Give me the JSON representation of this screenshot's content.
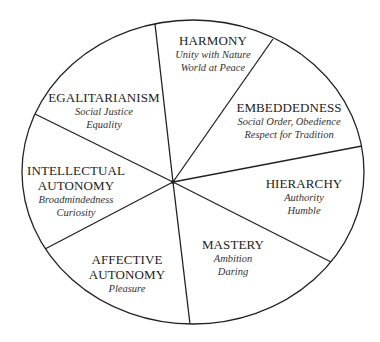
{
  "diagram": {
    "type": "circumplex",
    "colors": {
      "line": "#222222",
      "text": "#222222",
      "background": "#ffffff"
    },
    "segments": [
      {
        "title": [
          "HARMONY"
        ],
        "values": [
          "Unity with Nature",
          "World at Peace"
        ]
      },
      {
        "title": [
          "EMBEDDEDNESS"
        ],
        "values": [
          "Social Order, Obedience",
          "Respect for Tradition"
        ]
      },
      {
        "title": [
          "HIERARCHY"
        ],
        "values": [
          "Authority",
          "Humble"
        ]
      },
      {
        "title": [
          "MASTERY"
        ],
        "values": [
          "Ambition",
          "Daring"
        ]
      },
      {
        "title": [
          "AFFECTIVE",
          "AUTONOMY"
        ],
        "values": [
          "Pleasure"
        ]
      },
      {
        "title": [
          "INTELLECTUAL",
          "AUTONOMY"
        ],
        "values": [
          "Broadmindedness",
          "Curiosity"
        ]
      },
      {
        "title": [
          "EGALITARIANISM"
        ],
        "values": [
          "Social Justice",
          "Equality"
        ]
      }
    ]
  }
}
